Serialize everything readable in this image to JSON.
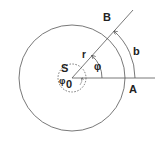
{
  "diagram": {
    "labels": {
      "point_b": "B",
      "arc_b": "b",
      "point_a": "A",
      "radius": "r",
      "angle": "φ",
      "small_circle": "S",
      "phi_zero_phi": "φ",
      "phi_zero_sub": "0"
    },
    "colors": {
      "stroke": "#444444",
      "text": "#222222",
      "background": "#ffffff"
    }
  }
}
